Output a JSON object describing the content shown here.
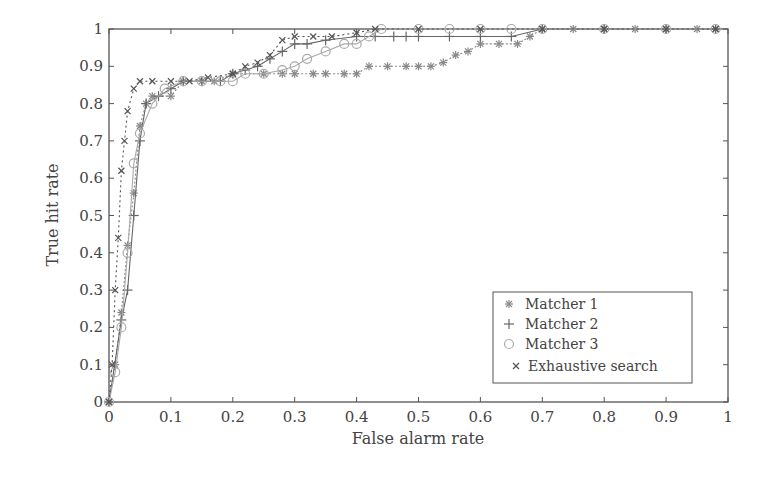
{
  "chart_data": {
    "type": "line",
    "title": "",
    "xlabel": "False alarm rate",
    "ylabel": "True hit rate",
    "xlim": [
      0,
      1
    ],
    "ylim": [
      0,
      1
    ],
    "xticks": [
      "0",
      "0.1",
      "0.2",
      "0.3",
      "0.4",
      "0.5",
      "0.6",
      "0.7",
      "0.8",
      "0.9",
      "1"
    ],
    "yticks": [
      "0",
      "0.1",
      "0.2",
      "0.3",
      "0.4",
      "0.5",
      "0.6",
      "0.7",
      "0.8",
      "0.9",
      "1"
    ],
    "grid": false,
    "legend_position": "lower right",
    "series": [
      {
        "name": "Matcher 1",
        "marker": "asterisk",
        "color": "#888888",
        "dash": "2,2",
        "points": [
          [
            0,
            0
          ],
          [
            0.01,
            0.1
          ],
          [
            0.02,
            0.24
          ],
          [
            0.03,
            0.42
          ],
          [
            0.04,
            0.56
          ],
          [
            0.05,
            0.74
          ],
          [
            0.06,
            0.8
          ],
          [
            0.07,
            0.82
          ],
          [
            0.1,
            0.82
          ],
          [
            0.12,
            0.86
          ],
          [
            0.15,
            0.86
          ],
          [
            0.17,
            0.86
          ],
          [
            0.2,
            0.88
          ],
          [
            0.25,
            0.88
          ],
          [
            0.28,
            0.88
          ],
          [
            0.3,
            0.88
          ],
          [
            0.33,
            0.88
          ],
          [
            0.35,
            0.88
          ],
          [
            0.38,
            0.88
          ],
          [
            0.4,
            0.88
          ],
          [
            0.42,
            0.9
          ],
          [
            0.45,
            0.9
          ],
          [
            0.48,
            0.9
          ],
          [
            0.5,
            0.9
          ],
          [
            0.52,
            0.9
          ],
          [
            0.54,
            0.91
          ],
          [
            0.56,
            0.93
          ],
          [
            0.58,
            0.94
          ],
          [
            0.6,
            0.96
          ],
          [
            0.63,
            0.96
          ],
          [
            0.66,
            0.96
          ],
          [
            0.68,
            0.98
          ],
          [
            0.7,
            1.0
          ],
          [
            0.75,
            1.0
          ],
          [
            0.8,
            1.0
          ],
          [
            0.85,
            1.0
          ],
          [
            0.9,
            1.0
          ],
          [
            0.95,
            1.0
          ],
          [
            0.98,
            1.0
          ]
        ]
      },
      {
        "name": "Matcher 2",
        "marker": "plus",
        "color": "#666666",
        "dash": "",
        "points": [
          [
            0,
            0
          ],
          [
            0.02,
            0.22
          ],
          [
            0.03,
            0.3
          ],
          [
            0.04,
            0.5
          ],
          [
            0.05,
            0.7
          ],
          [
            0.06,
            0.8
          ],
          [
            0.08,
            0.82
          ],
          [
            0.1,
            0.84
          ],
          [
            0.12,
            0.86
          ],
          [
            0.15,
            0.86
          ],
          [
            0.18,
            0.86
          ],
          [
            0.2,
            0.88
          ],
          [
            0.22,
            0.89
          ],
          [
            0.24,
            0.9
          ],
          [
            0.26,
            0.92
          ],
          [
            0.28,
            0.94
          ],
          [
            0.3,
            0.96
          ],
          [
            0.32,
            0.96
          ],
          [
            0.35,
            0.97
          ],
          [
            0.4,
            0.98
          ],
          [
            0.43,
            0.98
          ],
          [
            0.46,
            0.98
          ],
          [
            0.48,
            0.98
          ],
          [
            0.5,
            0.98
          ],
          [
            0.55,
            0.98
          ],
          [
            0.6,
            0.98
          ],
          [
            0.65,
            0.98
          ],
          [
            0.7,
            1.0
          ],
          [
            0.8,
            1.0
          ],
          [
            0.9,
            1.0
          ],
          [
            0.98,
            1.0
          ]
        ]
      },
      {
        "name": "Matcher 3",
        "marker": "circle",
        "color": "#aaaaaa",
        "dash": "",
        "points": [
          [
            0,
            0
          ],
          [
            0.01,
            0.08
          ],
          [
            0.02,
            0.2
          ],
          [
            0.03,
            0.4
          ],
          [
            0.04,
            0.64
          ],
          [
            0.05,
            0.72
          ],
          [
            0.07,
            0.8
          ],
          [
            0.09,
            0.84
          ],
          [
            0.12,
            0.86
          ],
          [
            0.15,
            0.86
          ],
          [
            0.18,
            0.86
          ],
          [
            0.2,
            0.86
          ],
          [
            0.22,
            0.88
          ],
          [
            0.25,
            0.88
          ],
          [
            0.28,
            0.89
          ],
          [
            0.3,
            0.9
          ],
          [
            0.32,
            0.92
          ],
          [
            0.35,
            0.94
          ],
          [
            0.38,
            0.96
          ],
          [
            0.4,
            0.96
          ],
          [
            0.42,
            0.98
          ],
          [
            0.44,
            1.0
          ],
          [
            0.5,
            1.0
          ],
          [
            0.55,
            1.0
          ],
          [
            0.6,
            1.0
          ],
          [
            0.65,
            1.0
          ],
          [
            0.7,
            1.0
          ],
          [
            0.8,
            1.0
          ],
          [
            0.9,
            1.0
          ],
          [
            0.98,
            1.0
          ]
        ]
      },
      {
        "name": "Exhaustive search",
        "marker": "cross",
        "color": "#555555",
        "dash": "2,3",
        "points": [
          [
            0,
            0
          ],
          [
            0.005,
            0.1
          ],
          [
            0.01,
            0.3
          ],
          [
            0.015,
            0.44
          ],
          [
            0.02,
            0.62
          ],
          [
            0.025,
            0.7
          ],
          [
            0.03,
            0.78
          ],
          [
            0.04,
            0.84
          ],
          [
            0.05,
            0.86
          ],
          [
            0.07,
            0.86
          ],
          [
            0.1,
            0.86
          ],
          [
            0.13,
            0.86
          ],
          [
            0.16,
            0.87
          ],
          [
            0.2,
            0.88
          ],
          [
            0.22,
            0.9
          ],
          [
            0.24,
            0.91
          ],
          [
            0.26,
            0.93
          ],
          [
            0.28,
            0.97
          ],
          [
            0.3,
            0.98
          ],
          [
            0.33,
            0.98
          ],
          [
            0.36,
            0.98
          ],
          [
            0.4,
            0.99
          ],
          [
            0.43,
            1.0
          ],
          [
            0.5,
            1.0
          ],
          [
            0.6,
            1.0
          ],
          [
            0.7,
            1.0
          ],
          [
            0.8,
            1.0
          ],
          [
            0.9,
            1.0
          ],
          [
            0.98,
            1.0
          ]
        ]
      }
    ]
  },
  "legend": {
    "items": [
      {
        "label": "Matcher 1"
      },
      {
        "label": "Matcher 2"
      },
      {
        "label": "Matcher 3"
      },
      {
        "label": "Exhaustive search"
      }
    ]
  }
}
